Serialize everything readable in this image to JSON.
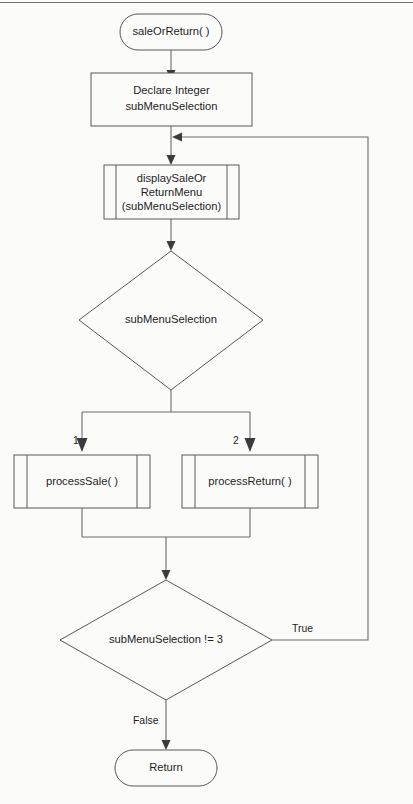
{
  "diagram": {
    "type": "flowchart",
    "colors": {
      "background": "#fbfbfa",
      "shape_stroke": "#58585a",
      "connector_stroke": "#6a6a6c",
      "text": "#1d1d1f"
    },
    "nodes": {
      "start": {
        "shape": "terminator",
        "label": "saleOrReturn( )"
      },
      "declare": {
        "shape": "process",
        "line1": "Declare Integer",
        "line2": "subMenuSelection"
      },
      "display_menu": {
        "shape": "module-call",
        "line1": "displaySaleOr",
        "line2": "ReturnMenu",
        "line3": "(subMenuSelection)"
      },
      "case_decision": {
        "shape": "decision",
        "label": "subMenuSelection"
      },
      "process_sale": {
        "shape": "module-call",
        "label": "processSale( )"
      },
      "process_return": {
        "shape": "module-call",
        "label": "processReturn( )"
      },
      "loop_decision": {
        "shape": "decision",
        "label": "subMenuSelection != 3"
      },
      "end": {
        "shape": "terminator",
        "label": "Return"
      }
    },
    "edge_labels": {
      "case_one": "1",
      "case_two": "2",
      "loop_true": "True",
      "loop_false": "False"
    }
  }
}
